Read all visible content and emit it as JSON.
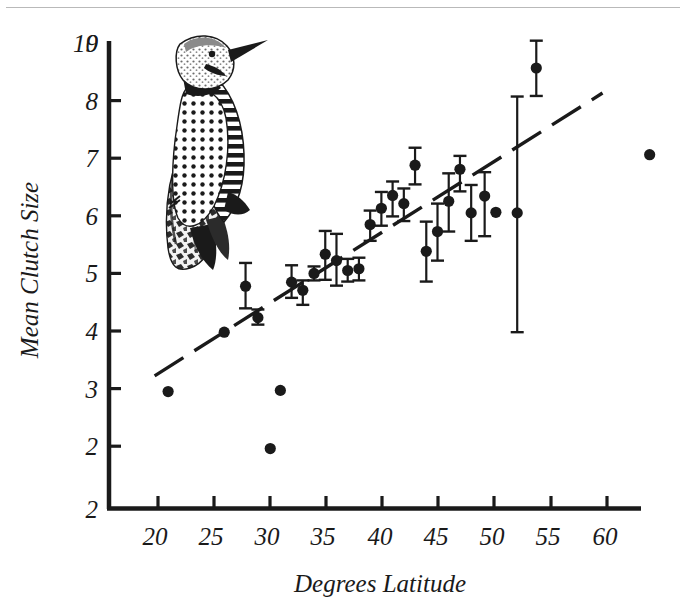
{
  "figure": {
    "background_color": "#ffffff",
    "ink_color": "#1a1a1a",
    "rule_color": "#b9b9b9"
  },
  "illustration": {
    "name": "northern-flicker-woodpecker",
    "description": "Pen-and-ink engraving of a Northern Flicker woodpecker clinging to a tree trunk",
    "position": {
      "x": 155,
      "y": 25,
      "width": 130,
      "height": 250
    }
  },
  "chart_data": {
    "type": "scatter",
    "title": "",
    "xlabel": "Degrees Latitude",
    "ylabel": "Mean Clutch Size",
    "xlim": [
      17,
      66
    ],
    "ylim": [
      2,
      10
    ],
    "xticks": [
      20,
      25,
      30,
      35,
      40,
      45,
      50,
      55,
      60
    ],
    "yticks": [
      2,
      3,
      4,
      5,
      6,
      7,
      8,
      9,
      10
    ],
    "xtick_labels": [
      "20",
      "25",
      "30",
      "35",
      "40",
      "45",
      "50",
      "55",
      "60"
    ],
    "ytick_labels": [
      "2",
      "3",
      "4",
      "5",
      "6",
      "7",
      "8",
      "9",
      "10"
    ],
    "grid": false,
    "legend": "none",
    "marker": "filled-circle",
    "error_bars": "vertical-with-caps",
    "series": [
      {
        "name": "Mean clutch size by latitude",
        "x": [
          20.9,
          25.9,
          27.8,
          28.9,
          30.0,
          30.9,
          31.9,
          32.9,
          33.9,
          34.9,
          35.9,
          36.9,
          37.9,
          38.9,
          39.9,
          40.9,
          41.9,
          42.9,
          43.9,
          44.9,
          45.9,
          46.9,
          47.9,
          49.1,
          50.1,
          52.0,
          53.7,
          63.8
        ],
        "y": [
          4.01,
          5.03,
          5.82,
          5.28,
          3.03,
          4.03,
          5.89,
          5.75,
          6.04,
          6.37,
          6.26,
          6.09,
          6.12,
          6.88,
          7.16,
          7.38,
          7.24,
          7.9,
          6.42,
          6.76,
          7.28,
          7.83,
          7.08,
          7.37,
          7.09,
          7.08,
          9.57,
          8.08
        ],
        "y_lower": [
          null,
          null,
          5.44,
          5.16,
          null,
          null,
          5.62,
          5.5,
          5.92,
          5.93,
          5.83,
          5.9,
          5.92,
          6.6,
          6.86,
          7.02,
          6.94,
          7.57,
          5.9,
          6.26,
          6.76,
          7.45,
          6.6,
          6.68,
          null,
          5.03,
          9.09,
          null
        ],
        "y_upper": [
          null,
          null,
          6.22,
          5.42,
          null,
          null,
          6.18,
          5.92,
          6.16,
          6.77,
          6.72,
          6.29,
          6.31,
          7.12,
          7.44,
          7.62,
          7.5,
          8.2,
          6.93,
          7.24,
          7.76,
          8.06,
          7.56,
          7.78,
          null,
          9.08,
          10.04,
          null
        ]
      }
    ],
    "trend_line": {
      "name": "dashed-regression-line",
      "style": "dashed-to-solid",
      "x_start": 19.7,
      "y_start": 4.28,
      "x_end": 59.6,
      "y_end": 9.14,
      "slope": 0.122,
      "intercept": 1.88
    }
  }
}
